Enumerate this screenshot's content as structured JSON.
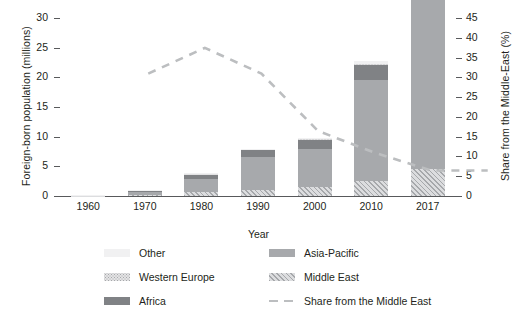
{
  "chart_data": {
    "type": "bar",
    "title": "",
    "subtitle": "",
    "xlabel": "Year",
    "ylabel": "Foreign-born population (millions)",
    "y2label": "Share from the Middle-East (%)",
    "categories": [
      "1960",
      "1970",
      "1980",
      "1990",
      "2000",
      "2010",
      "2017"
    ],
    "ylim": [
      0,
      30
    ],
    "yticks": [
      "0",
      "5",
      "10",
      "15",
      "20",
      "25",
      "30"
    ],
    "y2lim": [
      0,
      45
    ],
    "y2ticks": [
      "0",
      "5",
      "10",
      "15",
      "20",
      "25",
      "30",
      "35",
      "40",
      "45"
    ],
    "grid": true,
    "legend_position": "bottom",
    "stacked": true,
    "series": [
      {
        "name": "Middle East",
        "values": [
          0.03,
          0.18,
          0.62,
          1.05,
          1.55,
          2.45,
          4.55
        ]
      },
      {
        "name": "Asia-Pacific",
        "values": [
          0.1,
          0.55,
          2.2,
          5.6,
          6.35,
          17.1,
          30.2
        ]
      },
      {
        "name": "Africa",
        "values": [
          0.03,
          0.15,
          0.85,
          1.1,
          1.55,
          2.6,
          3.7
        ]
      },
      {
        "name": "Western Europe",
        "values": [
          0.02,
          0.07,
          0.08,
          0.1,
          0.1,
          0.12,
          0.15
        ]
      },
      {
        "name": "Other",
        "values": [
          0.02,
          0.05,
          0.05,
          0.15,
          0.15,
          0.45,
          0.6
        ]
      }
    ],
    "line_series": {
      "name": "Share from the Middle East",
      "axis": "y2",
      "style": "dashed",
      "values": [
        35.5,
        42.0,
        35.5,
        21.0,
        15.5,
        11.0,
        11.0
      ]
    },
    "legend": [
      {
        "label": "Other",
        "swatch": "other"
      },
      {
        "label": "Asia-Pacific",
        "swatch": "asiapacific"
      },
      {
        "label": "Western Europe",
        "swatch": "westerneurope"
      },
      {
        "label": "Middle East",
        "swatch": "middleeast"
      },
      {
        "label": "Africa",
        "swatch": "africa"
      },
      {
        "label": "Share from the Middle East",
        "swatch": "dashed-line"
      }
    ],
    "colors": {
      "other": "#f1f1f2",
      "western_europe": "#e3e3e4",
      "africa": "#808285",
      "asia_pacific": "#a7a9ac",
      "middle_east": "#dcdddf",
      "share_line": "#bcbec0",
      "axis": "#58595b",
      "grid": "#ededee",
      "text": "#231f20"
    }
  }
}
